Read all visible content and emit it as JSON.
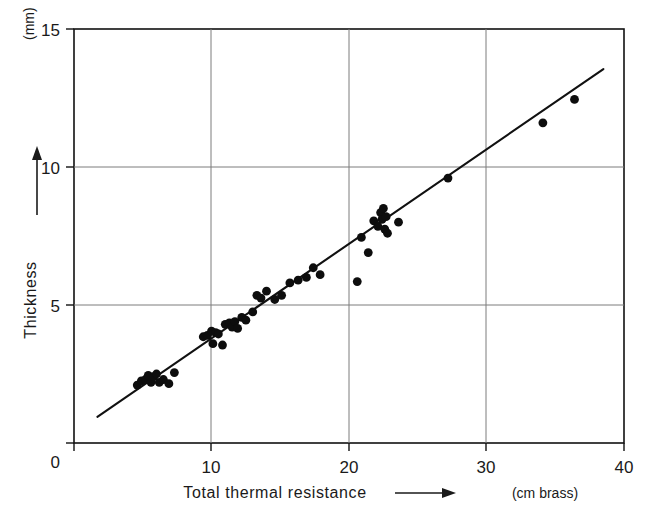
{
  "chart_data": {
    "type": "scatter",
    "title": "",
    "xlabel": "Total thermal resistance",
    "ylabel": "Thickness",
    "x_unit": "(cm brass)",
    "y_unit": "(mm)",
    "xlim": [
      0,
      40
    ],
    "ylim": [
      0,
      15
    ],
    "xticks": [
      0,
      10,
      20,
      30,
      40
    ],
    "xtick_labels": [
      "0",
      "10",
      "20",
      "30",
      "40"
    ],
    "yticks": [
      0,
      5,
      10,
      15
    ],
    "ytick_labels": [
      "0",
      "5",
      "10",
      "15"
    ],
    "grid": true,
    "grid_x": [
      10,
      20,
      30
    ],
    "grid_y": [
      5,
      10
    ],
    "legend": "none",
    "x_arrow": true,
    "y_arrow": true,
    "fit_line": {
      "label": "least-squares fit",
      "x_start": 1.7,
      "y_start": 0.95,
      "x_end": 38.5,
      "y_end": 13.55
    },
    "points": [
      {
        "x": 4.6,
        "y": 2.1
      },
      {
        "x": 4.9,
        "y": 2.25
      },
      {
        "x": 5.2,
        "y": 2.3
      },
      {
        "x": 5.4,
        "y": 2.45
      },
      {
        "x": 5.6,
        "y": 2.2
      },
      {
        "x": 5.8,
        "y": 2.4
      },
      {
        "x": 6.0,
        "y": 2.5
      },
      {
        "x": 6.2,
        "y": 2.2
      },
      {
        "x": 6.5,
        "y": 2.3
      },
      {
        "x": 6.9,
        "y": 2.15
      },
      {
        "x": 7.3,
        "y": 2.55
      },
      {
        "x": 9.4,
        "y": 3.85
      },
      {
        "x": 9.7,
        "y": 3.9
      },
      {
        "x": 10.0,
        "y": 4.05
      },
      {
        "x": 10.1,
        "y": 3.6
      },
      {
        "x": 10.3,
        "y": 4.0
      },
      {
        "x": 10.5,
        "y": 3.95
      },
      {
        "x": 10.8,
        "y": 3.55
      },
      {
        "x": 11.0,
        "y": 4.3
      },
      {
        "x": 11.3,
        "y": 4.35
      },
      {
        "x": 11.5,
        "y": 4.2
      },
      {
        "x": 11.7,
        "y": 4.4
      },
      {
        "x": 11.9,
        "y": 4.15
      },
      {
        "x": 12.2,
        "y": 4.55
      },
      {
        "x": 12.5,
        "y": 4.45
      },
      {
        "x": 13.0,
        "y": 4.75
      },
      {
        "x": 13.3,
        "y": 5.35
      },
      {
        "x": 13.6,
        "y": 5.25
      },
      {
        "x": 14.0,
        "y": 5.5
      },
      {
        "x": 14.6,
        "y": 5.2
      },
      {
        "x": 15.1,
        "y": 5.35
      },
      {
        "x": 15.7,
        "y": 5.8
      },
      {
        "x": 16.3,
        "y": 5.9
      },
      {
        "x": 16.9,
        "y": 6.0
      },
      {
        "x": 17.4,
        "y": 6.35
      },
      {
        "x": 17.9,
        "y": 6.1
      },
      {
        "x": 20.6,
        "y": 5.85
      },
      {
        "x": 20.9,
        "y": 7.45
      },
      {
        "x": 21.4,
        "y": 6.9
      },
      {
        "x": 21.8,
        "y": 8.05
      },
      {
        "x": 22.1,
        "y": 7.85
      },
      {
        "x": 22.3,
        "y": 8.35
      },
      {
        "x": 22.4,
        "y": 8.1
      },
      {
        "x": 22.5,
        "y": 8.5
      },
      {
        "x": 22.6,
        "y": 7.75
      },
      {
        "x": 22.7,
        "y": 8.2
      },
      {
        "x": 22.8,
        "y": 7.6
      },
      {
        "x": 23.6,
        "y": 8.0
      },
      {
        "x": 27.2,
        "y": 9.6
      },
      {
        "x": 34.1,
        "y": 11.6
      },
      {
        "x": 36.4,
        "y": 12.45
      }
    ],
    "point_count": 51,
    "colors": {
      "point": "#0d0d0d",
      "line": "#111111",
      "grid": "#7d7d7d",
      "frame": "#111111",
      "background": "#ffffff"
    }
  }
}
